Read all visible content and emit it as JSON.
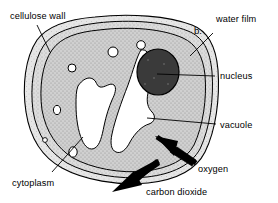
{
  "figure": {
    "panel_letter": "b."
  },
  "labels": {
    "cellulose_wall": "cellulose wall",
    "water_film": "water film",
    "nucleus": "nucleus",
    "vacuole": "vacuole",
    "cytoplasm": "cytoplasm",
    "oxygen": "oxygen",
    "carbon_dioxide": "carbon dioxide"
  },
  "colors": {
    "outline": "#000000",
    "background": "#ffffff",
    "water_film_fill": "#e3e3e3",
    "cellulose_wall_fill": "#d2d2d2",
    "cytoplasm_fill": "#cccccc",
    "vacuole_fill": "#ffffff",
    "nucleus_fill": "#3a3a3a",
    "arrow_fill": "#000000"
  },
  "structures": [
    {
      "name": "water-film",
      "label": "water film",
      "fill": "#e3e3e3"
    },
    {
      "name": "cellulose-wall",
      "label": "cellulose wall",
      "fill": "#d2d2d2"
    },
    {
      "name": "cytoplasm",
      "label": "cytoplasm",
      "fill": "#cccccc"
    },
    {
      "name": "vacuole",
      "label": "vacuole",
      "fill": "#ffffff"
    },
    {
      "name": "nucleus",
      "label": "nucleus",
      "fill": "#3a3a3a"
    }
  ],
  "gas_arrows": [
    {
      "name": "oxygen",
      "label": "oxygen",
      "direction": "into-cell"
    },
    {
      "name": "carbon-dioxide",
      "label": "carbon dioxide",
      "direction": "out-of-cell"
    }
  ],
  "vesicle_count": 6
}
